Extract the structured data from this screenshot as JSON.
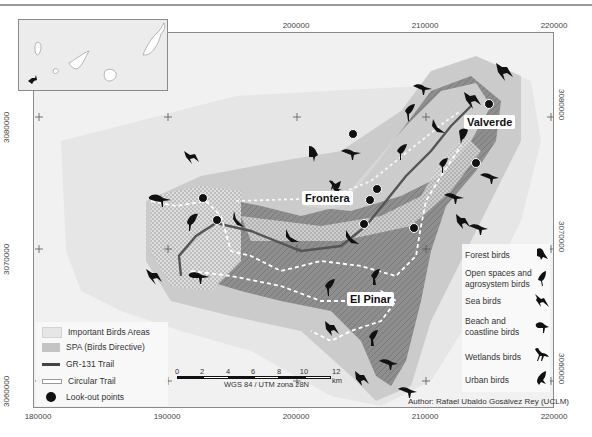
{
  "map": {
    "title": "El Hierro – Birdwatching map",
    "axes": {
      "x_ticks": [
        "180000",
        "190000",
        "200000",
        "210000",
        "220000"
      ],
      "x_ticks_top": [
        "200000",
        "210000",
        "220000"
      ],
      "y_ticks": [
        "3080000",
        "3070000",
        "3060000"
      ],
      "x_tick_positions_px": [
        38,
        167,
        296,
        425,
        554
      ],
      "y_tick_positions_px": [
        116,
        248,
        380
      ]
    },
    "towns": [
      {
        "name": "Valverde",
        "x": 463,
        "y": 114
      },
      {
        "name": "Frontera",
        "x": 301,
        "y": 190
      },
      {
        "name": "El Pinar",
        "x": 346,
        "y": 291
      }
    ],
    "legend_left": {
      "items": [
        {
          "label": "Important Birds Areas",
          "swatch": "iba"
        },
        {
          "label": "SPA (Birds Directive)",
          "swatch": "spa"
        },
        {
          "label": "GR-131 Trail",
          "swatch": "gr131"
        },
        {
          "label": "Circular Trail",
          "swatch": "circular"
        },
        {
          "label": "Look-out points",
          "swatch": "lookout"
        }
      ]
    },
    "legend_birds": {
      "items": [
        {
          "label": "Forest birds",
          "icon": "forest-bird-icon"
        },
        {
          "label": "Open spaces and agrosystem birds",
          "icon": "open-space-bird-icon"
        },
        {
          "label": "Sea birds",
          "icon": "sea-bird-icon"
        },
        {
          "label": "Beach and coastline birds",
          "icon": "coastline-bird-icon"
        },
        {
          "label": "Wetlands birds",
          "icon": "wetland-bird-icon"
        },
        {
          "label": "Urban birds",
          "icon": "urban-bird-icon"
        }
      ]
    },
    "scale": {
      "labels": [
        "0",
        "2",
        "4",
        "6",
        "8",
        "10",
        "12 km"
      ],
      "projection": "WGS 84 / UTM zona 28N"
    },
    "author": "Author: Rafael Ubaldo Gosálvez Rey (UCLM)",
    "colors": {
      "background": "#f1f1f1",
      "spa": "#c9c9c9",
      "iba": "#e2e2e2",
      "island": "#8c8c8c",
      "trail": "#555555",
      "lookout": "#111111"
    }
  }
}
